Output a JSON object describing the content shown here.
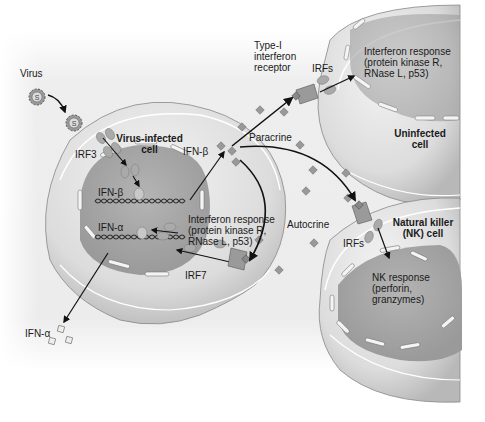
{
  "diagram": {
    "colors": {
      "background_panel": "#ececec",
      "cell_fill": "#d6d6d6",
      "cell_highlight": "#f2f2f2",
      "nucleus_fill": "#a9a9a9",
      "arrow": "#111111",
      "text": "#1a1a1a"
    },
    "labels": {
      "virus": "Virus",
      "virus_infected_cell_line1": "Virus-infected",
      "virus_infected_cell_line2": "cell",
      "irf3": "IRF3",
      "ifn_beta_nucleus": "IFN-β",
      "ifn_alpha_nucleus": "IFN-α",
      "ifn_beta_secreted": "IFN-β",
      "ifn_alpha_secreted": "IFN-α",
      "irf7": "IRF7",
      "autocrine_response_line1": "Interferon response",
      "autocrine_response_line2": "(protein kinase R,",
      "autocrine_response_line3": "RNase L, p53)",
      "autocrine": "Autocrine",
      "paracrine": "Paracrine",
      "receptor_line1": "Type-I",
      "receptor_line2": "interferon",
      "receptor_line3": "receptor",
      "irfs_uninfected": "IRFs",
      "uninfected_response_line1": "Interferon response",
      "uninfected_response_line2": "(protein kinase R,",
      "uninfected_response_line3": "RNase L, p53)",
      "uninfected_cell_line1": "Uninfected",
      "uninfected_cell_line2": "cell",
      "nk_cell_line1": "Natural killer",
      "nk_cell_line2": "(NK) cell",
      "irfs_nk": "IRFs",
      "nk_response_line1": "NK response",
      "nk_response_line2": "(perforin,",
      "nk_response_line3": "granzymes)"
    }
  }
}
